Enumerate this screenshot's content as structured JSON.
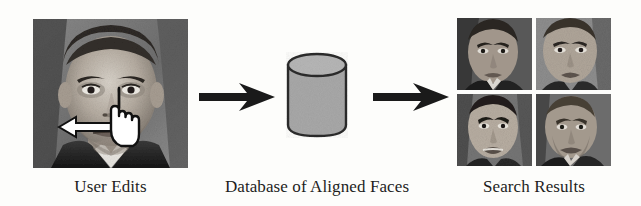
{
  "figure": {
    "width": 641,
    "height": 206,
    "background_color": "#fdfdfb",
    "type": "pipeline-diagram"
  },
  "stages": [
    {
      "id": "user-edits",
      "caption": "User Edits",
      "media": "grayscale-portrait-photo",
      "overlays": [
        "drag-arrow-left",
        "pointing-hand-cursor"
      ]
    },
    {
      "id": "database",
      "caption": "Database of Aligned Faces",
      "media": "cylinder-database-icon"
    },
    {
      "id": "search-results",
      "caption": "Search Results",
      "media": "2x2-face-thumbnail-grid",
      "thumbnail_count": 4
    }
  ],
  "connectors": [
    {
      "id": "flow-arrow-1",
      "direction": "right",
      "color": "#1a1a1a"
    },
    {
      "id": "flow-arrow-2",
      "direction": "right",
      "color": "#1a1a1a"
    }
  ],
  "overlays": {
    "drag_arrow": {
      "direction": "left",
      "fill_color": "#ffffff",
      "stroke_color": "#111111"
    },
    "hand_cursor": {
      "icon": "pointing-hand-cursor",
      "fill_color": "#ffffff",
      "stroke_color": "#111111"
    }
  },
  "colors": {
    "arrow_black": "#1a1a1a",
    "cylinder_fill": "#a8a8a8",
    "cylinder_top": "#b4b4b4",
    "cylinder_stroke": "#2b2b2b",
    "caption_text": "#1d1d1d",
    "page_background": "#fdfdfb"
  }
}
